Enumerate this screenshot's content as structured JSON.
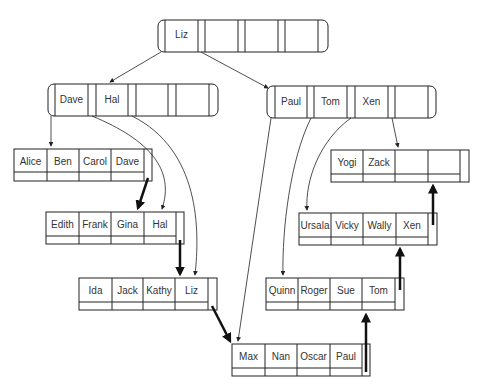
{
  "root": {
    "keys": [
      "Liz",
      "",
      "",
      ""
    ]
  },
  "internal": [
    {
      "id": "left",
      "keys": [
        "Dave",
        "Hal",
        "",
        ""
      ]
    },
    {
      "id": "right",
      "keys": [
        "Paul",
        "Tom",
        "Xen",
        ""
      ]
    }
  ],
  "leaves": [
    {
      "id": "leaf1",
      "keys": [
        "Alice",
        "Ben",
        "Carol",
        "Dave"
      ]
    },
    {
      "id": "leaf2",
      "keys": [
        "Edith",
        "Frank",
        "Gina",
        "Hal"
      ]
    },
    {
      "id": "leaf3",
      "keys": [
        "Ida",
        "Jack",
        "Kathy",
        "Liz"
      ]
    },
    {
      "id": "leaf4",
      "keys": [
        "Max",
        "Nan",
        "Oscar",
        "Paul"
      ]
    },
    {
      "id": "leaf5",
      "keys": [
        "Quinn",
        "Roger",
        "Sue",
        "Tom"
      ]
    },
    {
      "id": "leaf6",
      "keys": [
        "Ursala",
        "Vicky",
        "Wally",
        "Xen"
      ]
    },
    {
      "id": "leaf7",
      "keys": [
        "Yogi",
        "Zack",
        "",
        ""
      ]
    }
  ],
  "colors": {
    "line": "#222222",
    "text": "#333333",
    "background": "#ffffff"
  }
}
